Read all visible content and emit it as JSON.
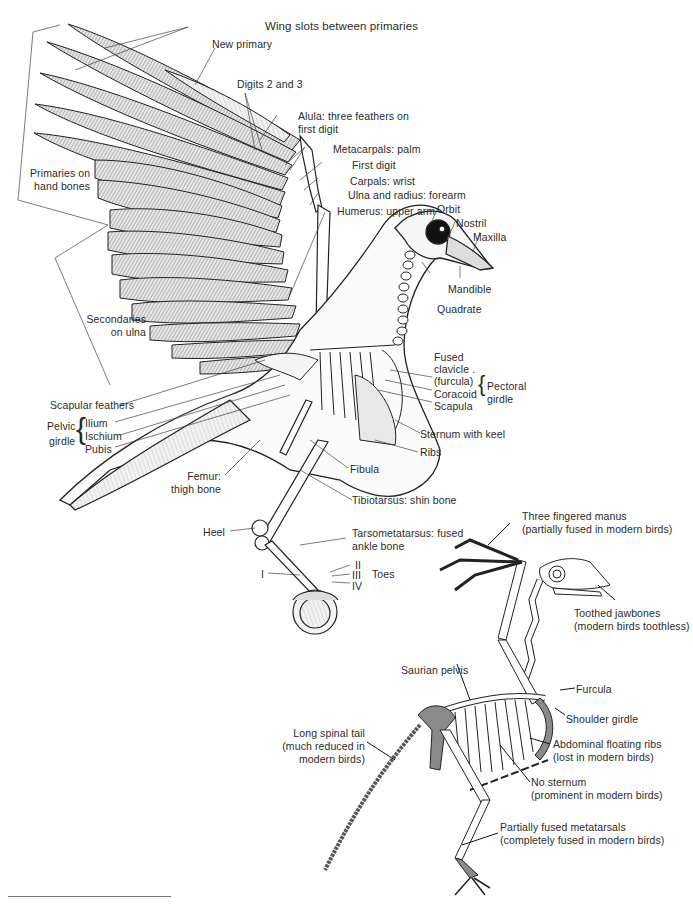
{
  "figure": {
    "modern_bird": {
      "labels": {
        "wing_slots": "Wing slots between primaries",
        "new_primary": "New primary",
        "digits_2_3": "Digits 2 and 3",
        "alula_1": "Alula: three feathers on",
        "alula_2": "first digit",
        "metacarpals": "Metacarpals: palm",
        "first_digit": "First digit",
        "carpals": "Carpals: wrist",
        "ulna_radius": "Ulna and radius: forearm",
        "humerus": "Humerus: upper arm",
        "orbit": "Orbit",
        "nostril": "Nostril",
        "maxilla": "Maxilla",
        "mandible": "Mandible",
        "quadrate": "Quadrate",
        "primaries_1": "Primaries on",
        "primaries_2": "hand bones",
        "secondaries_1": "Secondaries",
        "secondaries_2": "on ulna",
        "fused_clavicle_1": "Fused",
        "fused_clavicle_2": "clavicle .",
        "fused_clavicle_3": "(furcula)",
        "coracoid": "Coracoid",
        "scapula": "Scapula",
        "pectoral_1": "Pectoral",
        "pectoral_2": "girdle",
        "sternum": "Sternum with keel",
        "ribs": "Ribs",
        "scapular_feathers": "Scapular feathers",
        "pelvic_1": "Pelvic",
        "pelvic_2": "girdle",
        "ilium": "Ilium",
        "ischium": "Ischium",
        "pubis": "Pubis",
        "fibula": "Fibula",
        "femur_1": "Femur:",
        "femur_2": "thigh bone",
        "tibiotarsus": "Tibiotarsus: shin bone",
        "heel": "Heel",
        "tarso_1": "Tarsometatarsus: fused",
        "tarso_2": "ankle bone",
        "toe_1": "I",
        "toe_2": "II",
        "toe_3": "III",
        "toe_4": "IV",
        "toes": "Toes"
      }
    },
    "ancestral_bird": {
      "labels": {
        "manus_1": "Three fingered manus",
        "manus_2": "(partially fused in modern birds)",
        "jaw_1": "Toothed jawbones",
        "jaw_2": "(modern birds toothless)",
        "pelvis": "Saurian pelvis",
        "furcula": "Furcula",
        "shoulder": "Shoulder girdle",
        "tail_1": "Long spinal tail",
        "tail_2": "(much reduced in",
        "tail_3": "modern birds)",
        "floating_1": "Abdominal floating ribs",
        "floating_2": "(lost in modern birds)",
        "sternum_1": "No sternum",
        "sternum_2": "(prominent in modern birds)",
        "meta_1": "Partially fused metatarsals",
        "meta_2": "(completely fused in modern birds)"
      }
    },
    "colors": {
      "ink": "#1e1e1e",
      "feather_fill": "#cfcfcf",
      "bone_fill": "#ffffff",
      "highlight_bone": "#8a8a8a",
      "leader_line": "#3a3a3a"
    }
  }
}
